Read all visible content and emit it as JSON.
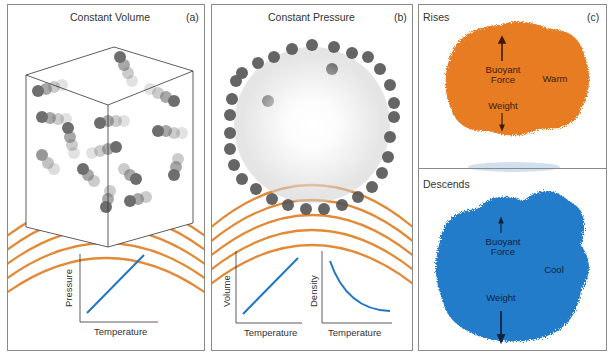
{
  "panels": {
    "a": {
      "title": "Constant Volume",
      "letter": "(a)",
      "graph": {
        "xlabel": "Temperature",
        "ylabel": "Pressure",
        "curve": "linear-increasing"
      }
    },
    "b": {
      "title": "Constant Pressure",
      "letter": "(b)",
      "graphs": [
        {
          "xlabel": "Temperature",
          "ylabel": "Volume",
          "curve": "linear-increasing"
        },
        {
          "xlabel": "Temperature",
          "ylabel": "Density",
          "curve": "decreasing-convex"
        }
      ]
    },
    "c": {
      "letter": "(c)",
      "top": {
        "title": "Rises",
        "force_up": "Buoyant\nForce",
        "force_down": "Weight",
        "state": "Warm",
        "color": "#e8781e"
      },
      "bottom": {
        "title": "Descends",
        "force_up": "Buoyant\nForce",
        "force_down": "Weight",
        "state": "Cool",
        "color": "#1a78c8"
      }
    }
  },
  "colors": {
    "arc": "#e38a36",
    "line": "#1f77c4",
    "border": "#8a8a8a"
  }
}
